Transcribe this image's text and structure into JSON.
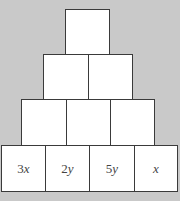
{
  "diagram": {
    "title": "",
    "type": "number-pyramid",
    "rows": [
      {
        "level": 1,
        "cells": [
          {
            "label": ""
          }
        ]
      },
      {
        "level": 2,
        "cells": [
          {
            "label": ""
          },
          {
            "label": ""
          }
        ]
      },
      {
        "level": 3,
        "cells": [
          {
            "label": ""
          },
          {
            "label": ""
          },
          {
            "label": ""
          }
        ]
      },
      {
        "level": 4,
        "cells": [
          {
            "label": "3x",
            "coef": "3",
            "var": "x"
          },
          {
            "label": "2y",
            "coef": "2",
            "var": "y"
          },
          {
            "label": "5y",
            "coef": "5",
            "var": "y"
          },
          {
            "label": "x",
            "coef": "",
            "var": "x"
          }
        ]
      }
    ]
  },
  "colors": {
    "background": "#c9c9c9",
    "cell_fill": "#ffffff",
    "border": "#3a3a3a",
    "text": "#444444"
  }
}
